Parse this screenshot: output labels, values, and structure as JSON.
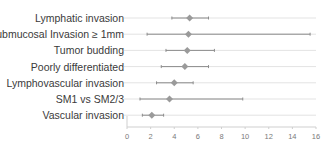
{
  "chart_data": {
    "type": "forest",
    "title": "",
    "xlabel": "",
    "ylabel": "",
    "xlim": [
      0,
      16
    ],
    "xticks": [
      0,
      2,
      4,
      6,
      8,
      10,
      12,
      14,
      16
    ],
    "grid": "horizontal row lines",
    "categories": [
      "Lymphatic invasion",
      "Submucosal Invasion ≥ 1mm",
      "Tumor budding",
      "Poorly differentiated",
      "Lymphovascular invasion",
      "SM1 vs SM2/3",
      "Vascular invasion"
    ],
    "series": [
      {
        "name": "Estimate (95% CI)",
        "values": [
          5.3,
          5.2,
          5.1,
          4.9,
          4.0,
          3.6,
          2.1
        ],
        "lower": [
          3.8,
          1.7,
          3.3,
          2.9,
          2.5,
          1.1,
          1.3
        ],
        "upper": [
          6.9,
          15.5,
          7.4,
          6.9,
          5.6,
          9.8,
          3.1
        ]
      }
    ],
    "colors": {
      "marker": "#9a9a9a",
      "ci_line": "#8c8c8c",
      "row_line": "#e3e3e3",
      "axis": "#cfcfcf"
    }
  }
}
